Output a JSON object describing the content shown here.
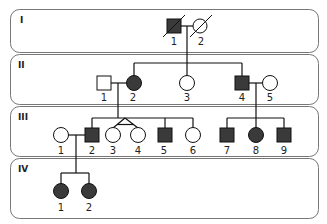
{
  "diagram": {
    "type": "pedigree",
    "colors": {
      "affected": "#3a3a3a",
      "unaffected": "#ffffff",
      "line": "#111111",
      "panel_border": "#777777"
    },
    "generations": [
      {
        "label": "I",
        "individuals": [
          {
            "id": "I-1",
            "num": "1",
            "sex": "male",
            "affected": true,
            "deceased": true
          },
          {
            "id": "I-2",
            "num": "2",
            "sex": "female",
            "affected": false,
            "deceased": true
          }
        ]
      },
      {
        "label": "II",
        "individuals": [
          {
            "id": "II-1",
            "num": "1",
            "sex": "male",
            "affected": false
          },
          {
            "id": "II-2",
            "num": "2",
            "sex": "female",
            "affected": true
          },
          {
            "id": "II-3",
            "num": "3",
            "sex": "female",
            "affected": false
          },
          {
            "id": "II-4",
            "num": "4",
            "sex": "male",
            "affected": true
          },
          {
            "id": "II-5",
            "num": "5",
            "sex": "female",
            "affected": false
          }
        ]
      },
      {
        "label": "III",
        "individuals": [
          {
            "id": "III-1",
            "num": "1",
            "sex": "female",
            "affected": false
          },
          {
            "id": "III-2",
            "num": "2",
            "sex": "male",
            "affected": true
          },
          {
            "id": "III-3",
            "num": "3",
            "sex": "female",
            "affected": false,
            "twin": "monozygotic"
          },
          {
            "id": "III-4",
            "num": "4",
            "sex": "female",
            "affected": false,
            "twin": "monozygotic"
          },
          {
            "id": "III-5",
            "num": "5",
            "sex": "male",
            "affected": true
          },
          {
            "id": "III-6",
            "num": "6",
            "sex": "female",
            "affected": false
          },
          {
            "id": "III-7",
            "num": "7",
            "sex": "male",
            "affected": true
          },
          {
            "id": "III-8",
            "num": "8",
            "sex": "female",
            "affected": true
          },
          {
            "id": "III-9",
            "num": "9",
            "sex": "male",
            "affected": true
          }
        ]
      },
      {
        "label": "IV",
        "individuals": [
          {
            "id": "IV-1",
            "num": "1",
            "sex": "female",
            "affected": true
          },
          {
            "id": "IV-2",
            "num": "2",
            "sex": "female",
            "affected": true
          }
        ]
      }
    ],
    "matings": [
      {
        "partners": [
          "I-1",
          "I-2"
        ],
        "children": [
          "II-2",
          "II-3",
          "II-4"
        ]
      },
      {
        "partners": [
          "II-1",
          "II-2"
        ],
        "children": [
          "III-2",
          "III-3",
          "III-4",
          "III-5",
          "III-6"
        ]
      },
      {
        "partners": [
          "II-4",
          "II-5"
        ],
        "children": [
          "III-7",
          "III-8",
          "III-9"
        ]
      },
      {
        "partners": [
          "III-1",
          "III-2"
        ],
        "children": [
          "IV-1",
          "IV-2"
        ]
      }
    ]
  }
}
